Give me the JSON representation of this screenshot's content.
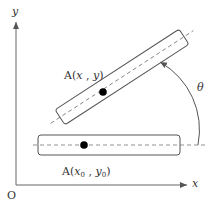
{
  "diagram": {
    "axes": {
      "x_label": "x",
      "y_label": "y",
      "origin_label": "O"
    },
    "initial_body": {
      "point_label_prefix": "A(",
      "point_var_x": "x",
      "point_sub_x": "0",
      "separator": " , ",
      "point_var_y": "y",
      "point_sub_y": "0",
      "point_label_suffix": ")"
    },
    "rotated_body": {
      "point_label_prefix": "A(",
      "point_var_x": "x",
      "separator": " , ",
      "point_var_y": "y",
      "point_label_suffix": ")"
    },
    "rotation_angle_label": "θ",
    "colors": {
      "stroke": "#555555",
      "dot": "#000000",
      "dashed": "#777777"
    }
  }
}
